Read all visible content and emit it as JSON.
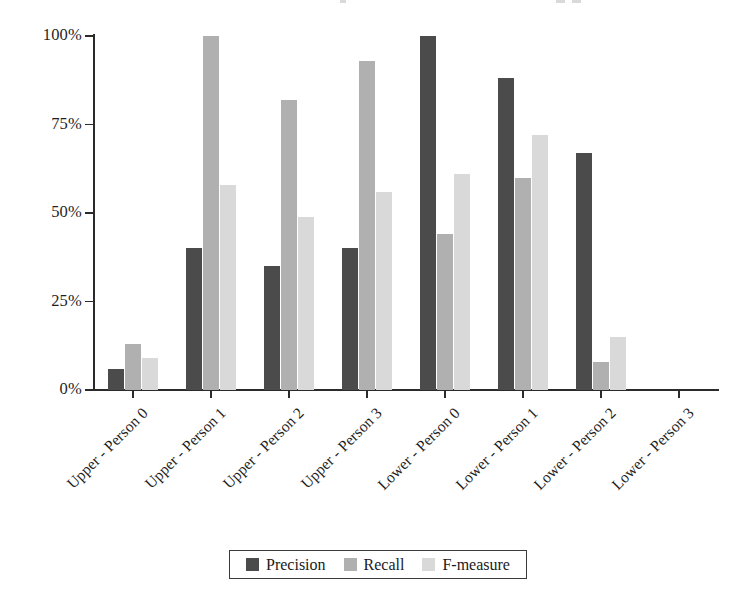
{
  "chart_data": {
    "type": "bar",
    "title": "",
    "xlabel": "",
    "ylabel": "",
    "ylim": [
      0,
      100
    ],
    "ytick_labels": [
      "0%",
      "25%",
      "50%",
      "75%",
      "100%"
    ],
    "ytick_values": [
      0,
      25,
      50,
      75,
      100
    ],
    "grid": false,
    "legend_position": "bottom",
    "categories": [
      "Upper - Person 0",
      "Upper - Person 1",
      "Upper - Person 2",
      "Upper - Person 3",
      "Lower - Person 0",
      "Lower - Person 1",
      "Lower - Person 2",
      "Lower - Person 3"
    ],
    "series": [
      {
        "name": "Precision",
        "color": "#4b4b4b",
        "values": [
          6,
          40,
          35,
          40,
          100,
          88,
          67,
          0
        ]
      },
      {
        "name": "Recall",
        "color": "#b0b0b0",
        "values": [
          13,
          100,
          82,
          93,
          44,
          60,
          8,
          0
        ]
      },
      {
        "name": "F-measure",
        "color": "#d9d9d9",
        "values": [
          9,
          58,
          49,
          56,
          61,
          72,
          15,
          0
        ]
      }
    ]
  },
  "legend": {
    "entries": [
      {
        "label": "Precision",
        "color": "#4b4b4b"
      },
      {
        "label": "Recall",
        "color": "#b0b0b0"
      },
      {
        "label": "F-measure",
        "color": "#d9d9d9"
      }
    ]
  }
}
